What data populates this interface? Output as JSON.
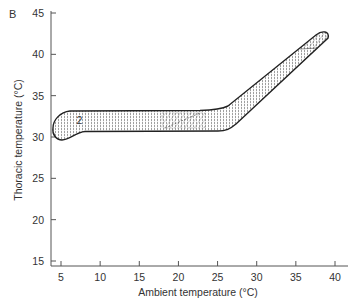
{
  "panel": {
    "label": "B"
  },
  "chart_data": {
    "type": "area",
    "title": "",
    "xlabel": "Ambient temperature (°C)",
    "ylabel": "Thoracic temperature (°C)",
    "xlim": [
      4,
      41
    ],
    "ylim": [
      15,
      45
    ],
    "x_ticks": [
      5,
      10,
      15,
      20,
      25,
      30,
      35,
      40
    ],
    "y_ticks": [
      15,
      20,
      25,
      30,
      35,
      40,
      45
    ],
    "grid": false,
    "legend": null,
    "annotations": [
      {
        "text": "2",
        "x": 7.5,
        "y": 32
      }
    ],
    "series": [
      {
        "name": "upper boundary",
        "x": [
          4.3,
          5.0,
          6.0,
          10,
          15,
          20,
          23,
          25,
          28,
          31,
          33,
          35
        ],
        "y": [
          30.6,
          32.0,
          33.0,
          33.0,
          33.1,
          33.2,
          33.6,
          35.0,
          37.5,
          40.0,
          41.5,
          43.0
        ]
      },
      {
        "name": "lower boundary",
        "x": [
          4.3,
          5.0,
          6.0,
          8.0,
          10,
          15,
          20,
          24,
          26,
          28,
          31,
          33,
          35.5
        ],
        "y": [
          30.6,
          29.7,
          30.0,
          31.0,
          31.0,
          31.0,
          31.0,
          31.2,
          33.0,
          35.0,
          38.0,
          40.0,
          42.4
        ]
      }
    ]
  }
}
